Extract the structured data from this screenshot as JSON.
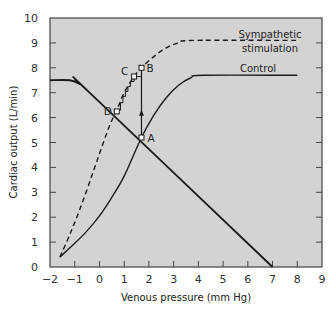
{
  "chart_data": {
    "type": "line",
    "title": "",
    "xlabel": "Venous pressure (mm Hg)",
    "ylabel": "Cardiac output (L/min)",
    "xlim": [
      -2,
      9
    ],
    "ylim": [
      0,
      10
    ],
    "xticks": [
      -2,
      -1,
      0,
      1,
      2,
      3,
      4,
      5,
      6,
      7,
      8,
      9
    ],
    "yticks": [
      0,
      1,
      2,
      3,
      4,
      5,
      6,
      7,
      8,
      9,
      10
    ],
    "grid": false,
    "background": "#d3d3d3",
    "series": [
      {
        "name": "Control",
        "style": "solid",
        "points": [
          [
            -1.6,
            0.4
          ],
          [
            -1.0,
            0.95
          ],
          [
            -0.5,
            1.45
          ],
          [
            0.0,
            2.05
          ],
          [
            0.5,
            2.8
          ],
          [
            1.0,
            3.65
          ],
          [
            1.7,
            5.2
          ],
          [
            2.2,
            6.1
          ],
          [
            2.7,
            6.8
          ],
          [
            3.2,
            7.3
          ],
          [
            3.7,
            7.6
          ],
          [
            4.2,
            7.7
          ],
          [
            8.0,
            7.7
          ]
        ]
      },
      {
        "name": "Sympathetic stimulation",
        "style": "dashed",
        "points": [
          [
            -1.6,
            0.4
          ],
          [
            -1.2,
            1.3
          ],
          [
            -0.8,
            2.3
          ],
          [
            -0.4,
            3.4
          ],
          [
            0.0,
            4.55
          ],
          [
            0.4,
            5.65
          ],
          [
            0.7,
            6.3
          ],
          [
            1.0,
            7.0
          ],
          [
            1.4,
            7.65
          ],
          [
            1.7,
            8.0
          ],
          [
            2.2,
            8.45
          ],
          [
            2.7,
            8.8
          ],
          [
            3.2,
            9.0
          ],
          [
            3.8,
            9.1
          ],
          [
            8.0,
            9.1
          ]
        ]
      },
      {
        "name": "Venous return",
        "style": "solid",
        "points": [
          [
            -2.0,
            7.5
          ],
          [
            -1.2,
            7.5
          ],
          [
            -0.8,
            7.35
          ],
          [
            -0.4,
            7.0
          ],
          [
            7.0,
            0.0
          ]
        ]
      }
    ],
    "annotations": [
      {
        "label": "A",
        "x": 1.7,
        "y": 5.2
      },
      {
        "label": "B",
        "x": 1.7,
        "y": 8.0
      },
      {
        "label": "C",
        "x": 1.4,
        "y": 7.65
      },
      {
        "label": "D",
        "x": 0.7,
        "y": 6.25
      }
    ],
    "legend": [
      {
        "text_line1": "Sympathetic",
        "text_line2": "stimulation",
        "series": "Sympathetic stimulation"
      },
      {
        "text_line1": "Control",
        "series": "Control"
      }
    ]
  }
}
